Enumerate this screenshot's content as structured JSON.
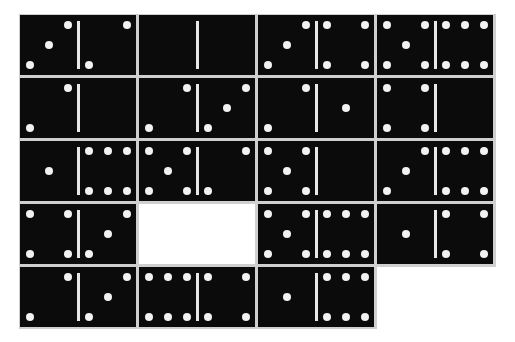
{
  "board": {
    "rows": 5,
    "cols": 4,
    "tile_color": "#0b0b0b",
    "pip_color": "#f2f2f2",
    "gap_color": "#cfcfcf",
    "tiles": [
      [
        {
          "left": 3,
          "right": 2
        },
        {
          "left": 0,
          "right": 0
        },
        {
          "left": 3,
          "right": 4
        },
        {
          "left": 5,
          "right": 6
        }
      ],
      [
        {
          "left": 2,
          "right": 0
        },
        {
          "left": 2,
          "right": 3
        },
        {
          "left": 2,
          "right": 1
        },
        {
          "left": 4,
          "right": 0
        }
      ],
      [
        {
          "left": 1,
          "right": 6
        },
        {
          "left": 5,
          "right": 2
        },
        {
          "left": 5,
          "right": 0
        },
        {
          "left": 3,
          "right": 6
        }
      ],
      [
        {
          "left": 4,
          "right": 3
        },
        null,
        {
          "left": 5,
          "right": 6
        },
        {
          "left": 1,
          "right": 4
        }
      ],
      [
        {
          "left": 2,
          "right": 3
        },
        {
          "left": 6,
          "right": 4
        },
        {
          "left": 1,
          "right": 6
        },
        null
      ]
    ]
  }
}
